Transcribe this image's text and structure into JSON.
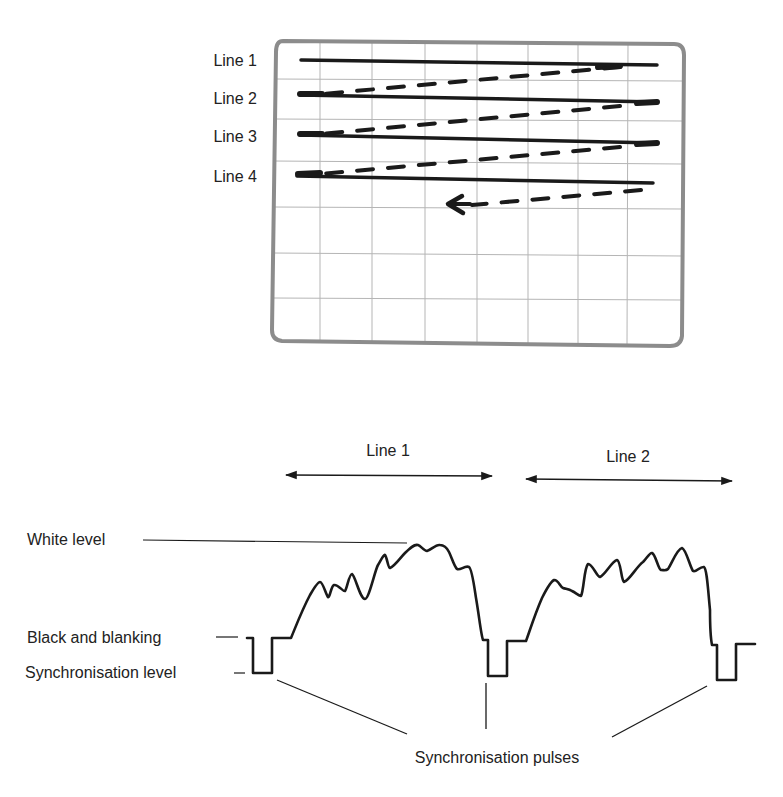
{
  "screen": {
    "scan_lines": [
      {
        "label": "Line 1"
      },
      {
        "label": "Line 2"
      },
      {
        "label": "Line 3"
      },
      {
        "label": "Line 4"
      }
    ]
  },
  "waveform": {
    "line_spans": [
      {
        "label": "Line 1"
      },
      {
        "label": "Line 2"
      }
    ],
    "levels": {
      "white": "White level",
      "black": "Black and blanking",
      "sync": "Synchronisation level"
    },
    "pulses_label": "Synchronisation pulses"
  },
  "colors": {
    "ink": "#1a1a1a",
    "grid": "#b5b5b5",
    "screen_border": "#8c8c8c",
    "background": "#ffffff"
  }
}
